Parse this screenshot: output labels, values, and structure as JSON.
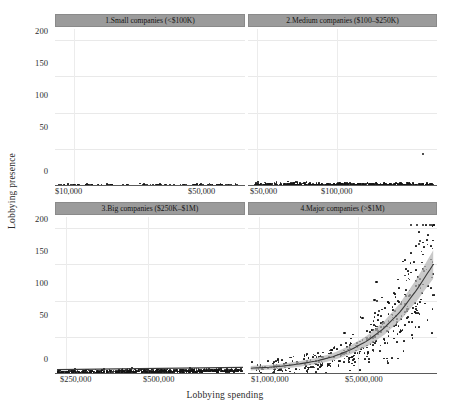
{
  "chart_data": {
    "type": "scatter",
    "title": "",
    "xlabel": "Lobbying spending",
    "ylabel": "Lobbying presence",
    "ylim": [
      0,
      215
    ],
    "yticks": [
      0,
      50,
      100,
      150,
      200
    ],
    "ytick_labels": [
      "0",
      "50",
      "100",
      "150",
      "200"
    ],
    "grid": true,
    "legend": false,
    "facet_layout": "2x2",
    "panels": [
      {
        "id": "panel-1",
        "title": "1.Small companies (<$100K)",
        "position": "top-left",
        "xtick_labels": [
          "$10,000",
          "$50,000"
        ],
        "xtick_positions": [
          0.08,
          0.84
        ],
        "n_points": 520,
        "y_range": [
          0,
          12
        ],
        "trend": "flat",
        "fit_shown": false,
        "description": "Dense flat band of points near zero with clumps at round spending values"
      },
      {
        "id": "panel-2",
        "title": "2.Medium companies ($100–$250K)",
        "position": "top-right",
        "xtick_labels": [
          "$50,000",
          "$100,000"
        ],
        "xtick_positions": [
          0.03,
          0.45
        ],
        "n_points": 640,
        "y_range": [
          0,
          20
        ],
        "outliers": [
          {
            "x": 0.92,
            "y": 45
          }
        ],
        "trend": "flat",
        "fit_shown": false,
        "description": "Dense band of points from 0 to about 20 with one outlier near 45"
      },
      {
        "id": "panel-3",
        "title": "3.Big companies ($250K–$1M)",
        "position": "bottom-left",
        "xtick_labels": [
          "$250,000",
          "$500,000"
        ],
        "xtick_positions": [
          0.04,
          0.47
        ],
        "n_points": 600,
        "y_range": [
          0,
          30
        ],
        "trend": "slightly-increasing",
        "fit_shown": true,
        "description": "Dense band from 0 to about 25 with faint nearly flat fitted line"
      },
      {
        "id": "panel-4",
        "title": "4.Major companies (>$1M)",
        "position": "bottom-right",
        "xtick_labels": [
          "$1,000,000",
          "$5,000,000"
        ],
        "xtick_positions": [
          0.04,
          0.56
        ],
        "n_points": 430,
        "y_range": [
          0,
          205
        ],
        "trend": "exponential-increasing",
        "fit_shown": true,
        "fit_curve_y": [
          8,
          9,
          11,
          14,
          18,
          24,
          33,
          45,
          62,
          85,
          115,
          150
        ],
        "confidence_band": true,
        "description": "Scatter rising steeply with exponential fitted curve and grey confidence ribbon from about 8 up to 150"
      }
    ],
    "colors": {
      "point": "#141414",
      "fit_line": "#3a3a3a",
      "confidence_band": "#b4b4b4",
      "strip_background": "#9b9b9b",
      "gridline": "#e9e9e9",
      "axis": "#5a5a5a",
      "background": "#ffffff"
    }
  }
}
